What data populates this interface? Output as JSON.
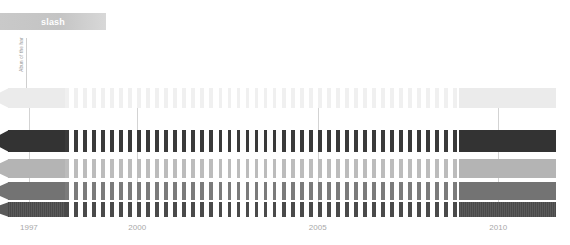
{
  "header": {
    "title": "slash"
  },
  "yaxis": {
    "label": "Abun of the har",
    "arrow_icon": "arrow-down-icon"
  },
  "chart_data": {
    "type": "heatmap",
    "title": "slash",
    "xlabel": "",
    "ylabel": "Abun of the har",
    "xlim": [
      1996.2,
      2011.6
    ],
    "grid": true,
    "legend": false,
    "xtick_labels": [
      "1997",
      "2000",
      "2005",
      "2010"
    ],
    "xtick_values": [
      1997,
      2000,
      2005,
      2010
    ],
    "gridline_values": [
      1997,
      2000,
      2005,
      2010
    ],
    "solid_left_end": 1998.0,
    "solid_right_end": 2008.9,
    "dash_period_years": 0.25,
    "series": [
      {
        "name": "row-1",
        "color": "#ebebeb",
        "dash_color": "#f0f0f0",
        "row_top_px": 0,
        "row_height_px": 20,
        "striped": false
      },
      {
        "name": "row-2",
        "color": "#333333",
        "dash_color": "#3a3a3a",
        "row_top_px": 42,
        "row_height_px": 22,
        "striped": false
      },
      {
        "name": "row-3",
        "color": "#b4b4b4",
        "dash_color": "#bcbcbc",
        "row_top_px": 71,
        "row_height_px": 19,
        "striped": false
      },
      {
        "name": "row-4",
        "color": "#737373",
        "dash_color": "#7b7b7b",
        "row_top_px": 94,
        "row_height_px": 18,
        "striped": false
      },
      {
        "name": "row-5",
        "color": "#5a5a5a",
        "dash_color": "#4a4a4a",
        "row_top_px": 114,
        "row_height_px": 15,
        "striped": true
      }
    ],
    "colors": {
      "gridline": "#d3d3d3",
      "tick_label": "#a9a9a9",
      "title_bar": "#c6c6c6",
      "title_text": "#ffffff",
      "axis_line": "#cfcfcf"
    }
  }
}
